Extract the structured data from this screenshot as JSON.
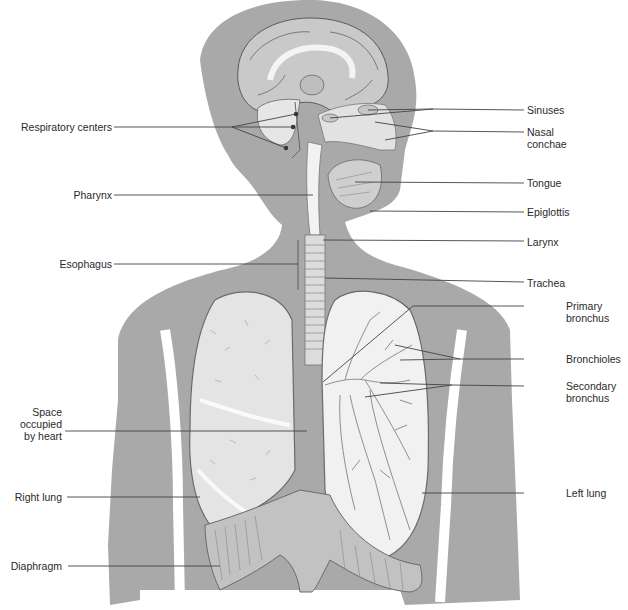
{
  "figure": {
    "colors": {
      "body_fill": "#a7a7a7",
      "organ_fill": "#e9e9e9",
      "organ_stroke": "#6a6a6a",
      "leader_line": "#444444",
      "background": "#ffffff"
    }
  },
  "labels": {
    "left": [
      {
        "id": "respiratory-centers",
        "text": "Respiratory centers"
      },
      {
        "id": "pharynx",
        "text": "Pharynx"
      },
      {
        "id": "esophagus",
        "text": "Esophagus"
      },
      {
        "id": "space-heart",
        "text": "Space occupied by heart",
        "lines": [
          "Space",
          "occupied",
          "by heart"
        ]
      },
      {
        "id": "right-lung",
        "text": "Right lung"
      },
      {
        "id": "diaphragm",
        "text": "Diaphragm"
      }
    ],
    "right": [
      {
        "id": "sinuses",
        "text": "Sinuses"
      },
      {
        "id": "nasal-conchae",
        "text": "Nasal conchae",
        "lines": [
          "Nasal",
          "conchae"
        ]
      },
      {
        "id": "tongue",
        "text": "Tongue"
      },
      {
        "id": "epiglottis",
        "text": "Epiglottis"
      },
      {
        "id": "larynx",
        "text": "Larynx"
      },
      {
        "id": "trachea",
        "text": "Trachea"
      },
      {
        "id": "primary-bronchus",
        "text": "Primary bronchus",
        "lines": [
          "Primary",
          "bronchus"
        ]
      },
      {
        "id": "bronchioles",
        "text": "Bronchioles"
      },
      {
        "id": "secondary-bronchus",
        "text": "Secondary bronchus",
        "lines": [
          "Secondary",
          "bronchus"
        ]
      },
      {
        "id": "left-lung",
        "text": "Left lung"
      }
    ]
  }
}
